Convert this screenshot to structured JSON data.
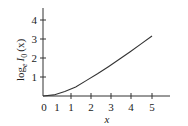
{
  "chart_data": {
    "type": "line",
    "title": "",
    "xlabel": "x",
    "ylabel": "log_e I_0 (x)",
    "ylabel_parts": {
      "base": "log",
      "sub": "e",
      "func": "I",
      "func_sub": "0",
      "arg": "(x)"
    },
    "xlim": [
      0,
      5.5
    ],
    "ylim": [
      0,
      4.5
    ],
    "x_tick_labels": [
      "0",
      "1",
      "1",
      "2",
      "3",
      "4",
      "5"
    ],
    "y_tick_labels": [
      "1",
      "2",
      "3",
      "4"
    ],
    "grid": false,
    "legend": null,
    "series": [
      {
        "name": "log_e I_0(x)",
        "x": [
          0,
          0.5,
          1,
          1.5,
          2,
          2.5,
          3,
          3.5,
          4,
          4.5,
          5
        ],
        "values": [
          0,
          0.06,
          0.24,
          0.48,
          0.82,
          1.17,
          1.54,
          1.93,
          2.33,
          2.74,
          3.16
        ]
      }
    ],
    "color": "#333333"
  }
}
